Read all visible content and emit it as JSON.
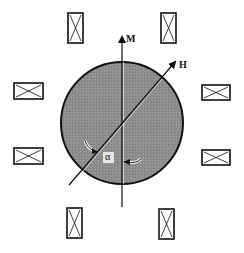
{
  "figure": {
    "type": "magnetization-vs-field schematic",
    "labels": {
      "magnetization": "M",
      "field": "H",
      "angle": "α"
    },
    "coils": [
      {
        "id": "top-left",
        "orientation": "vertical"
      },
      {
        "id": "top-right",
        "orientation": "vertical"
      },
      {
        "id": "left-upper",
        "orientation": "horizontal"
      },
      {
        "id": "left-lower",
        "orientation": "horizontal"
      },
      {
        "id": "right-upper",
        "orientation": "horizontal"
      },
      {
        "id": "right-lower",
        "orientation": "horizontal"
      },
      {
        "id": "bottom-left",
        "orientation": "vertical"
      },
      {
        "id": "bottom-right",
        "orientation": "vertical"
      }
    ],
    "colors": {
      "sample_fill": "#8c8c8c",
      "stroke": "#111111",
      "background": "#ffffff"
    }
  }
}
